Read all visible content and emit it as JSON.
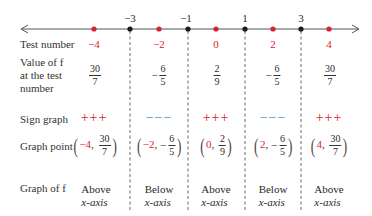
{
  "number_line": {
    "critical_points": [
      {
        "label": "−3",
        "x": 130
      },
      {
        "label": "−1",
        "x": 188
      },
      {
        "label": "1",
        "x": 245
      },
      {
        "label": "3",
        "x": 301
      }
    ],
    "test_points_x": [
      94,
      159,
      216,
      273,
      329
    ],
    "colors": {
      "critical": "#1a1a1a",
      "test": "#d8232a",
      "line": "#555555"
    }
  },
  "rows": {
    "test_number": {
      "label": "Test number",
      "values": [
        "−4",
        "−2",
        "0",
        "2",
        "4"
      ]
    },
    "value_of_f": {
      "label_lines": [
        "Value of f",
        "at the test",
        "number"
      ],
      "values": [
        {
          "sign": "",
          "num": "30",
          "den": "7"
        },
        {
          "sign": "−",
          "num": "6",
          "den": "5"
        },
        {
          "sign": "",
          "num": "2",
          "den": "9"
        },
        {
          "sign": "−",
          "num": "6",
          "den": "5"
        },
        {
          "sign": "",
          "num": "30",
          "den": "7"
        }
      ]
    },
    "sign_graph": {
      "label": "Sign graph",
      "values": [
        "+++",
        "−−−",
        "+++",
        "−−−",
        "+++"
      ]
    },
    "graph_point": {
      "label": "Graph point",
      "values": [
        {
          "x": "−4",
          "sign": "",
          "num": "30",
          "den": "7"
        },
        {
          "x": "−2",
          "sign": "−",
          "num": "6",
          "den": "5"
        },
        {
          "x": "0",
          "sign": "",
          "num": "2",
          "den": "9"
        },
        {
          "x": "2",
          "sign": "−",
          "num": "6",
          "den": "5"
        },
        {
          "x": "4",
          "sign": "",
          "num": "30",
          "den": "7"
        }
      ]
    },
    "graph_of_f": {
      "label": "Graph of f",
      "values": [
        {
          "pos": "Above",
          "axis": "x-axis"
        },
        {
          "pos": "Below",
          "axis": "x-axis"
        },
        {
          "pos": "Above",
          "axis": "x-axis"
        },
        {
          "pos": "Below",
          "axis": "x-axis"
        },
        {
          "pos": "Above",
          "axis": "x-axis"
        }
      ]
    }
  }
}
